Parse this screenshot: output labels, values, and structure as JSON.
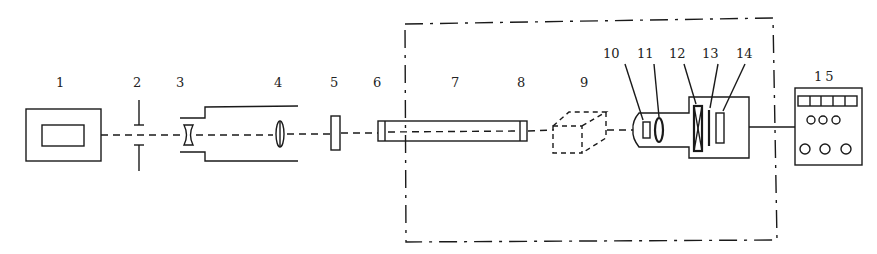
{
  "diagram": {
    "type": "optical-setup-schematic",
    "labels": [
      {
        "id": "1",
        "text": "1",
        "x": 56,
        "y": 76
      },
      {
        "id": "2",
        "text": "2",
        "x": 133,
        "y": 76
      },
      {
        "id": "3",
        "text": "3",
        "x": 176,
        "y": 76
      },
      {
        "id": "4",
        "text": "4",
        "x": 274,
        "y": 76
      },
      {
        "id": "5",
        "text": "5",
        "x": 330,
        "y": 76
      },
      {
        "id": "6",
        "text": "6",
        "x": 373,
        "y": 76
      },
      {
        "id": "7",
        "text": "7",
        "x": 451,
        "y": 76
      },
      {
        "id": "8",
        "text": "8",
        "x": 517,
        "y": 76
      },
      {
        "id": "9",
        "text": "9",
        "x": 580,
        "y": 76
      },
      {
        "id": "10",
        "text": "10",
        "x": 603,
        "y": 47
      },
      {
        "id": "11",
        "text": "11",
        "x": 637,
        "y": 47
      },
      {
        "id": "12",
        "text": "12",
        "x": 669,
        "y": 47
      },
      {
        "id": "13",
        "text": "13",
        "x": 702,
        "y": 47
      },
      {
        "id": "14",
        "text": "14",
        "x": 736,
        "y": 47
      },
      {
        "id": "15",
        "text": "15",
        "x": 814,
        "y": 70
      }
    ],
    "components": [
      {
        "id": "1",
        "name": "light-source-box"
      },
      {
        "id": "2",
        "name": "aperture"
      },
      {
        "id": "3",
        "name": "concave-lens"
      },
      {
        "id": "4",
        "name": "convex-lens"
      },
      {
        "id": "5",
        "name": "filter-plate"
      },
      {
        "id": "6",
        "name": "tube-entrance-window"
      },
      {
        "id": "7",
        "name": "sample-tube"
      },
      {
        "id": "8",
        "name": "tube-exit-window"
      },
      {
        "id": "9",
        "name": "optional-cube-element"
      },
      {
        "id": "10",
        "name": "slit-element"
      },
      {
        "id": "11",
        "name": "focusing-lens"
      },
      {
        "id": "12",
        "name": "crossed-element"
      },
      {
        "id": "13",
        "name": "thin-plate"
      },
      {
        "id": "14",
        "name": "detector-plate"
      },
      {
        "id": "15",
        "name": "control-instrument-panel"
      }
    ],
    "enclosure": {
      "style": "dash-dot",
      "x1": 405,
      "y1": 22,
      "x2": 775,
      "y2": 240
    },
    "colors": {
      "line": "#1a1a1a",
      "background": "#ffffff"
    }
  }
}
